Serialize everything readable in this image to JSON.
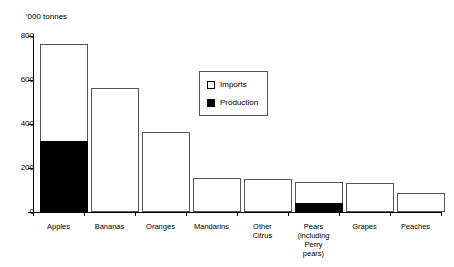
{
  "chart_data": {
    "type": "bar",
    "title": "",
    "xlabel": "",
    "ylabel": "'000 tonnes",
    "ylim": [
      0,
      800
    ],
    "yticks": [
      0,
      200,
      400,
      600,
      800
    ],
    "grid": false,
    "stacked": true,
    "legend_position": "inside-top-center",
    "categories": [
      "Apples",
      "Bananas",
      "Oranges",
      "Mandarins",
      "Other Citrus",
      "Pears (including Perry pears)",
      "Grapes",
      "Peaches"
    ],
    "category_lines": [
      [
        "Apples"
      ],
      [
        "Bananas"
      ],
      [
        "Oranges"
      ],
      [
        "Mandarins"
      ],
      [
        "Other",
        "Citrus"
      ],
      [
        "Pears",
        "(including",
        "Perry",
        "pears)"
      ],
      [
        "Grapes"
      ],
      [
        "Peaches"
      ]
    ],
    "series": [
      {
        "name": "Production",
        "color": "#000000",
        "values": [
          325,
          0,
          0,
          0,
          0,
          40,
          0,
          0
        ]
      },
      {
        "name": "Imports",
        "color": "#ffffff",
        "values": [
          440,
          563,
          365,
          153,
          148,
          98,
          132,
          86
        ]
      }
    ],
    "totals": [
      765,
      563,
      365,
      153,
      148,
      138,
      132,
      86
    ]
  },
  "legend": {
    "items": [
      {
        "label": "Imports",
        "swatch": "hollow"
      },
      {
        "label": "Production",
        "swatch": "filled"
      }
    ]
  }
}
